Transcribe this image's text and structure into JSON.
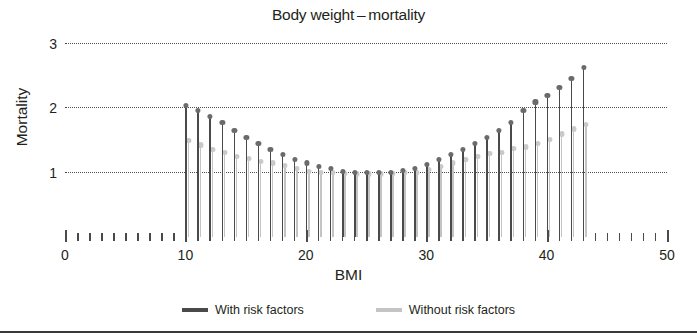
{
  "chart_data": {
    "type": "bar",
    "title": "Body weight – mortality",
    "xlabel": "BMI",
    "ylabel": "Mortality",
    "xlim": [
      0,
      50
    ],
    "ylim": [
      0,
      3
    ],
    "grid": true,
    "legend_position": "bottom",
    "x_ticks_major": [
      0,
      10,
      20,
      30,
      40,
      50
    ],
    "x_tick_interval": 1,
    "y_ticks": [
      1,
      2,
      3
    ],
    "categories": [
      10,
      11,
      12,
      13,
      14,
      15,
      16,
      17,
      18,
      19,
      20,
      21,
      22,
      23,
      24,
      25,
      26,
      27,
      28,
      29,
      30,
      31,
      32,
      33,
      34,
      35,
      36,
      37,
      38,
      39,
      40,
      41,
      42,
      43
    ],
    "series": [
      {
        "name": "With risk factors",
        "color": "#4a4a4a",
        "values": [
          2.05,
          1.97,
          1.87,
          1.78,
          1.66,
          1.55,
          1.45,
          1.36,
          1.28,
          1.2,
          1.15,
          1.1,
          1.07,
          1.02,
          1.0,
          1.0,
          1.0,
          1.0,
          1.03,
          1.07,
          1.13,
          1.2,
          1.28,
          1.36,
          1.45,
          1.55,
          1.65,
          1.78,
          1.97,
          2.1,
          2.2,
          2.33,
          2.47,
          2.63
        ]
      },
      {
        "name": "Without risk factors",
        "color": "#c4c4c4",
        "values": [
          1.5,
          1.43,
          1.36,
          1.31,
          1.25,
          1.22,
          1.18,
          1.15,
          1.11,
          1.07,
          1.02,
          1.0,
          1.0,
          0.99,
          0.98,
          0.98,
          0.98,
          0.99,
          1.0,
          1.0,
          1.05,
          1.1,
          1.15,
          1.2,
          1.25,
          1.3,
          1.32,
          1.37,
          1.4,
          1.45,
          1.52,
          1.6,
          1.68,
          1.75
        ]
      }
    ]
  },
  "legend": {
    "items": [
      {
        "label": "With risk factors",
        "color": "#4a4a4a"
      },
      {
        "label": "Without risk factors",
        "color": "#c4c4c4"
      }
    ]
  }
}
